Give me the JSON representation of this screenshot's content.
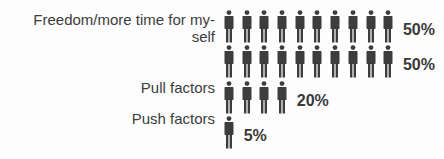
{
  "chart_data": {
    "type": "pictograph",
    "title": "",
    "icon": "person-icon",
    "icon_color": "#3d3d3d",
    "units_per_icon": "5%",
    "rows": [
      {
        "label": "Freedom/more time for my-self",
        "icons": 10,
        "value": 50,
        "value_label": "50%"
      },
      {
        "label": "",
        "icons": 10,
        "value": 50,
        "value_label": "50%"
      },
      {
        "label": "Pull factors",
        "icons": 4,
        "value": 20,
        "value_label": "20%"
      },
      {
        "label": "Push factors",
        "icons": 1,
        "value": 5,
        "value_label": "5%"
      }
    ]
  },
  "labels": {
    "row1_line1": "Freedom/more time for my-",
    "row1_line2": "self",
    "row3": "Pull factors",
    "row4": "Push factors"
  },
  "values": {
    "row1": "50%",
    "row2": "50%",
    "row3": "20%",
    "row4": "5%"
  }
}
